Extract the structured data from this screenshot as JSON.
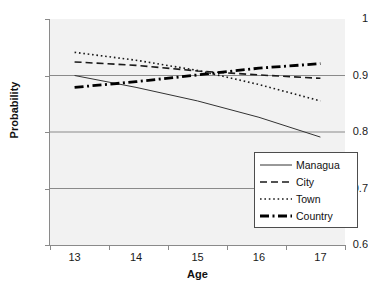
{
  "chart_data": {
    "type": "line",
    "title": "",
    "xlabel": "Age",
    "ylabel": "Probability",
    "x": [
      13,
      14,
      15,
      16,
      17
    ],
    "xlim": [
      12.6,
      17.4
    ],
    "ylim": [
      0.6,
      1.0
    ],
    "ytick_labels": [
      "1",
      "0.9",
      "0.8",
      "0.7",
      "0.6"
    ],
    "ytick_values": [
      1.0,
      0.9,
      0.8,
      0.7,
      0.6
    ],
    "xtick_labels": [
      "13",
      "14",
      "15",
      "16",
      "17"
    ],
    "grid": "horizontal",
    "legend_position": "lower-right",
    "plot_background": "#f2f2f2",
    "series": [
      {
        "name": "Managua",
        "style": "solid",
        "width": 1,
        "color": "#333333",
        "values": [
          0.9,
          0.879,
          0.855,
          0.826,
          0.791
        ]
      },
      {
        "name": "City",
        "style": "dashed",
        "width": 1.6,
        "color": "#1a1a1a",
        "values": [
          0.924,
          0.918,
          0.908,
          0.901,
          0.895
        ]
      },
      {
        "name": "Town",
        "style": "dotted",
        "width": 1.6,
        "color": "#1a1a1a",
        "values": [
          0.941,
          0.927,
          0.909,
          0.884,
          0.855
        ]
      },
      {
        "name": "Country",
        "style": "dashdot",
        "width": 2.8,
        "color": "#000000",
        "values": [
          0.879,
          0.889,
          0.901,
          0.913,
          0.921
        ]
      }
    ]
  },
  "legend": {
    "entries": [
      {
        "label": "Managua"
      },
      {
        "label": "City"
      },
      {
        "label": "Town"
      },
      {
        "label": "Country"
      }
    ]
  }
}
